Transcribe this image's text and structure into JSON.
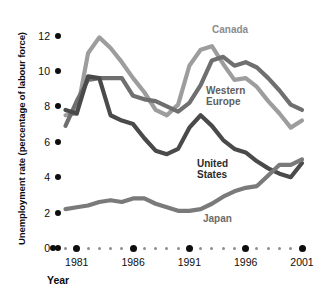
{
  "chart_data": {
    "type": "line",
    "title": "",
    "xlabel": "Year",
    "ylabel": "Unemployment rate (percentage of labour force)",
    "xlim": [
      1980,
      2001
    ],
    "ylim": [
      0,
      12.6
    ],
    "yticks": [
      0,
      2,
      4,
      6,
      8,
      10,
      12
    ],
    "ytick_labels": [
      "0",
      "2",
      "4",
      "6",
      "8",
      "10",
      "12"
    ],
    "xticks": [
      1981,
      1986,
      1991,
      1996,
      2001
    ],
    "xtick_labels": [
      "1981",
      "1986",
      "1991",
      "1996",
      "2001"
    ],
    "x": [
      1980,
      1981,
      1982,
      1983,
      1984,
      1985,
      1986,
      1987,
      1988,
      1989,
      1990,
      1991,
      1992,
      1993,
      1994,
      1995,
      1996,
      1997,
      1998,
      1999,
      2000,
      2001
    ],
    "grid": false,
    "legend_position": "inline-annotations",
    "series": [
      {
        "name": "Canada",
        "color": "#9d9d9d",
        "label_color": "#8c8c8c",
        "values": [
          7.5,
          7.6,
          11.0,
          11.9,
          11.3,
          10.5,
          9.6,
          8.8,
          7.8,
          7.5,
          8.1,
          10.3,
          11.2,
          11.4,
          10.4,
          9.5,
          9.6,
          9.1,
          8.3,
          7.6,
          6.8,
          7.2
        ]
      },
      {
        "name": "Western Europe",
        "color": "#6f6f6f",
        "label_color": "#5e5e5e",
        "values": [
          6.9,
          8.3,
          9.5,
          9.6,
          9.6,
          9.6,
          8.6,
          8.4,
          8.3,
          8.0,
          7.7,
          8.2,
          9.2,
          10.6,
          10.8,
          10.3,
          10.5,
          10.2,
          9.6,
          8.9,
          8.1,
          7.8
        ]
      },
      {
        "name": "United States",
        "color": "#4a4a4a",
        "label_color": "#2b2b2b",
        "values": [
          7.8,
          7.6,
          9.7,
          9.6,
          7.5,
          7.2,
          7.0,
          6.2,
          5.5,
          5.3,
          5.6,
          6.8,
          7.5,
          6.9,
          6.1,
          5.6,
          5.4,
          4.9,
          4.5,
          4.2,
          4.0,
          4.8
        ]
      },
      {
        "name": "Japan",
        "color": "#7a7a7a",
        "label_color": "#6b6b6b",
        "values": [
          2.2,
          2.3,
          2.4,
          2.6,
          2.7,
          2.6,
          2.8,
          2.8,
          2.5,
          2.3,
          2.1,
          2.1,
          2.2,
          2.5,
          2.9,
          3.2,
          3.4,
          3.5,
          4.1,
          4.7,
          4.7,
          5.0
        ]
      }
    ],
    "annotations": [
      {
        "text": "Canada",
        "x": 212,
        "y": 24,
        "color": "#8c8c8c"
      },
      {
        "text": "Western",
        "x": 206,
        "y": 85,
        "color": "#5e5e5e"
      },
      {
        "text": "Europe",
        "x": 206,
        "y": 96,
        "color": "#5e5e5e"
      },
      {
        "text": "United",
        "x": 197,
        "y": 158,
        "color": "#2b2b2b"
      },
      {
        "text": "States",
        "x": 197,
        "y": 169,
        "color": "#2b2b2b"
      },
      {
        "text": "Japan",
        "x": 203,
        "y": 213,
        "color": "#6b6b6b"
      }
    ]
  }
}
